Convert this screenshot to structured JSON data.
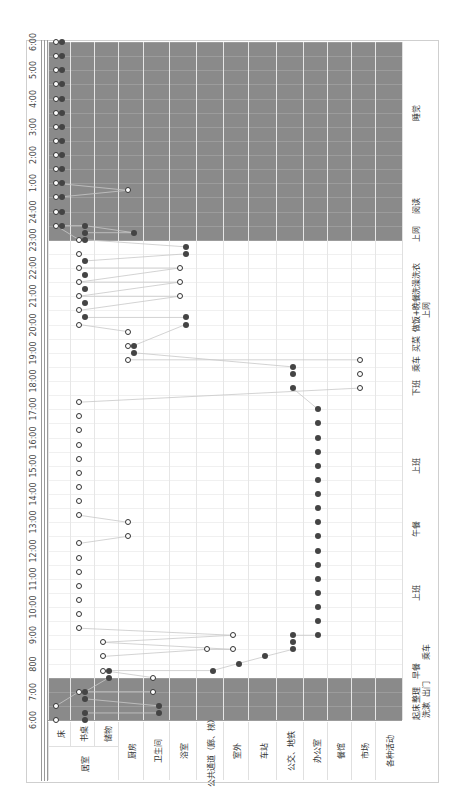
{
  "chart_data": {
    "type": "scatter",
    "title": "",
    "orientation": "rotated 90° counter-clockwise (time runs bottom→top, locations left→right)",
    "xlabel": "Location",
    "ylabel": "Time of day",
    "time_ticks": [
      "6:00",
      "7:00",
      "800",
      "9:00",
      "10:00",
      "11:00",
      "12:00",
      "13:00",
      "14:00",
      "15:00",
      "16:00",
      "17:00",
      "18:00",
      "19:00",
      "20:00",
      "21:00",
      "22:00",
      "23:00",
      "24:00",
      "1:00",
      "2:00",
      "3:00",
      "4:00",
      "5:00",
      "6:00"
    ],
    "location_group": {
      "label": "居室",
      "members": [
        "床",
        "书桌",
        "储物"
      ]
    },
    "categories": [
      "床",
      "书桌",
      "储物",
      "厨房",
      "卫生间",
      "浴室",
      "公共通道（廊、梯）",
      "室外",
      "车站",
      "公交、地铁",
      "办公室",
      "餐馆",
      "市场",
      "各种活动"
    ],
    "shaded_periods": [
      {
        "start": "6:00",
        "end": "7:30",
        "color": "#8a8a8a"
      },
      {
        "start": "23:00",
        "end": "6:00",
        "color": "#8a8a8a"
      }
    ],
    "legend": {
      "open_circle": "person A",
      "filled_circle": "person B"
    },
    "series": [
      {
        "name": "open circles",
        "marker": "open",
        "points": [
          {
            "t": 6.0,
            "loc": "床"
          },
          {
            "t": 6.5,
            "loc": "床"
          },
          {
            "t": 7.0,
            "loc": "书桌"
          },
          {
            "t": 7.0,
            "loc": "卫生间"
          },
          {
            "t": 7.5,
            "loc": "卫生间"
          },
          {
            "t": 7.75,
            "loc": "储物"
          },
          {
            "t": 8.25,
            "loc": "储物"
          },
          {
            "t": 8.75,
            "loc": "储物"
          },
          {
            "t": 8.5,
            "loc": "公共通道（廊、梯）"
          },
          {
            "t": 8.5,
            "loc": "室外"
          },
          {
            "t": 9.0,
            "loc": "室外"
          },
          {
            "t": 9.25,
            "loc": "书桌",
            "to": 12.25,
            "step": 0.5
          },
          {
            "t": 12.5,
            "loc": "厨房"
          },
          {
            "t": 13.0,
            "loc": "厨房"
          },
          {
            "t": 13.25,
            "loc": "书桌",
            "to": 17.25,
            "step": 0.5
          },
          {
            "t": 17.75,
            "loc": "市场"
          },
          {
            "t": 18.25,
            "loc": "市场"
          },
          {
            "t": 18.75,
            "loc": "市场"
          },
          {
            "t": 18.75,
            "loc": "厨房",
            "to": 19.75,
            "step": 0.5
          },
          {
            "t": 20.0,
            "loc": "书桌",
            "to": 20.5,
            "step": 0.5
          },
          {
            "t": 21.0,
            "loc": "浴室",
            "to": 22.0,
            "step": 0.5
          },
          {
            "t": 21.0,
            "loc": "书桌",
            "to": 23.0,
            "step": 0.5
          },
          {
            "t": 23.5,
            "loc": "床",
            "to": 24.5,
            "step": 0.5
          },
          {
            "t": 24.75,
            "loc": "厨房"
          },
          {
            "t": 25.0,
            "loc": "床",
            "to": 30.0,
            "step": 0.5
          }
        ]
      },
      {
        "name": "filled circles",
        "marker": "filled",
        "points": [
          {
            "t": 6.0,
            "loc": "书桌"
          },
          {
            "t": 6.25,
            "loc": "书桌"
          },
          {
            "t": 6.75,
            "loc": "书桌"
          },
          {
            "t": 7.0,
            "loc": "书桌"
          },
          {
            "t": 6.25,
            "loc": "卫生间"
          },
          {
            "t": 6.5,
            "loc": "卫生间"
          },
          {
            "t": 7.5,
            "loc": "储物"
          },
          {
            "t": 7.75,
            "loc": "储物"
          },
          {
            "t": 7.75,
            "loc": "公共通道（廊、梯）"
          },
          {
            "t": 8.0,
            "loc": "室外"
          },
          {
            "t": 8.25,
            "loc": "车站"
          },
          {
            "t": 8.5,
            "loc": "公交、地铁"
          },
          {
            "t": 8.75,
            "loc": "公交、地铁"
          },
          {
            "t": 9.0,
            "loc": "公交、地铁"
          },
          {
            "t": 9.0,
            "loc": "办公室",
            "to": 17.25,
            "step": 0.5
          },
          {
            "t": 17.75,
            "loc": "公交、地铁"
          },
          {
            "t": 18.25,
            "loc": "公交、地铁"
          },
          {
            "t": 18.5,
            "loc": "公交、地铁"
          },
          {
            "t": 19.0,
            "loc": "厨房"
          },
          {
            "t": 19.25,
            "loc": "厨房"
          },
          {
            "t": 20.0,
            "loc": "浴室"
          },
          {
            "t": 20.25,
            "loc": "浴室"
          },
          {
            "t": 20.25,
            "loc": "书桌",
            "to": 22.25,
            "step": 0.5
          },
          {
            "t": 22.5,
            "loc": "浴室"
          },
          {
            "t": 22.75,
            "loc": "浴室"
          },
          {
            "t": 23.0,
            "loc": "书桌",
            "to": 23.5,
            "step": 0.25
          },
          {
            "t": 23.25,
            "loc": "厨房"
          },
          {
            "t": 23.5,
            "loc": "床",
            "to": 30.0,
            "step": 0.5
          }
        ]
      }
    ],
    "activity_annotations": [
      {
        "label": "起床",
        "t": 6.3
      },
      {
        "label": "洗漱",
        "t": 6.35
      },
      {
        "label": "整理",
        "t": 6.9
      },
      {
        "label": "出门",
        "t": 7.1
      },
      {
        "label": "早餐",
        "t": 7.75
      },
      {
        "label": "乘车",
        "t": 8.4
      },
      {
        "label": "上班",
        "t": 10.5
      },
      {
        "label": "午餐",
        "t": 12.75
      },
      {
        "label": "上班",
        "t": 15.0
      },
      {
        "label": "下班",
        "t": 17.75
      },
      {
        "label": "乘车",
        "t": 18.6
      },
      {
        "label": "买菜",
        "t": 19.3
      },
      {
        "label": "做饭+晚餐",
        "t": 20.4
      },
      {
        "label": "上网",
        "t": 20.5
      },
      {
        "label": "洗澡洗衣",
        "t": 21.6
      },
      {
        "label": "上网",
        "t": 23.2
      },
      {
        "label": "阅读",
        "t": 24.2
      },
      {
        "label": "睡觉",
        "t": 27.5
      }
    ],
    "grid": true,
    "ylim": [
      "6:00",
      "6:00 (+1 day)"
    ]
  }
}
